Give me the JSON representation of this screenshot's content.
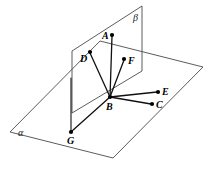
{
  "figure": {
    "width": 212,
    "height": 173,
    "background_color": "#ffffff",
    "line_color": "#111111",
    "plane_edge_color": "#4a4a4a"
  },
  "planes": [
    {
      "id": "alpha",
      "label": "α",
      "label_x": 18,
      "label_y": 128,
      "orientation": "horizontal",
      "outline": "10,132 113,158 203,67 100,41"
    },
    {
      "id": "beta",
      "label": "β",
      "label_x": 133,
      "label_y": 13,
      "orientation": "vertical",
      "outline": "72,51 142,6 142,71 72,113"
    }
  ],
  "points": [
    {
      "name": "A",
      "x": 112,
      "y": 35,
      "label": "A",
      "label_x": 102,
      "label_y": 31
    },
    {
      "name": "B",
      "x": 110,
      "y": 97,
      "label": "B",
      "label_x": 106,
      "label_y": 102
    },
    {
      "name": "C",
      "x": 152,
      "y": 104,
      "label": "C",
      "label_x": 156,
      "label_y": 100
    },
    {
      "name": "D",
      "x": 90,
      "y": 52,
      "label": "D",
      "label_x": 80,
      "label_y": 54
    },
    {
      "name": "E",
      "x": 158,
      "y": 92,
      "label": "E",
      "label_x": 162,
      "label_y": 87
    },
    {
      "name": "F",
      "x": 124,
      "y": 59,
      "label": "F",
      "label_x": 128,
      "label_y": 56
    },
    {
      "name": "G",
      "x": 71,
      "y": 132,
      "label": "G",
      "label_x": 67,
      "label_y": 136
    }
  ],
  "segments": [
    {
      "name": "BA",
      "from": "B",
      "to": "A",
      "x1": 110,
      "y1": 97,
      "x2": 112,
      "y2": 36
    },
    {
      "name": "BD",
      "from": "B",
      "to": "D",
      "x1": 110,
      "y1": 97,
      "x2": 90,
      "y2": 53
    },
    {
      "name": "BF",
      "from": "B",
      "to": "F",
      "x1": 110,
      "y1": 97,
      "x2": 124,
      "y2": 60
    },
    {
      "name": "BE",
      "from": "B",
      "to": "E",
      "x1": 110,
      "y1": 97,
      "x2": 157,
      "y2": 92
    },
    {
      "name": "BC",
      "from": "B",
      "to": "C",
      "x1": 110,
      "y1": 97,
      "x2": 151,
      "y2": 104
    },
    {
      "name": "BG",
      "from": "B",
      "to": "G",
      "x1": 110,
      "y1": 97,
      "x2": 72,
      "y2": 131
    },
    {
      "name": "vertical-edge-to-G",
      "from": "beta-left-edge",
      "to": "G",
      "x1": 71,
      "y1": 78,
      "x2": 71,
      "y2": 131
    }
  ]
}
